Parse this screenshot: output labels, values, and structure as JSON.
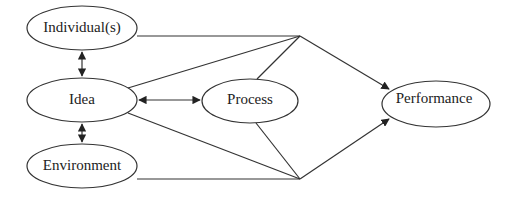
{
  "diagram": {
    "type": "flow",
    "nodes": [
      {
        "id": "individuals",
        "label": "Individual(s)",
        "cx": 82,
        "cy": 28,
        "rx": 55,
        "ry": 22
      },
      {
        "id": "idea",
        "label": "Idea",
        "cx": 82,
        "cy": 100,
        "rx": 55,
        "ry": 22
      },
      {
        "id": "process",
        "label": "Process",
        "cx": 250,
        "cy": 101,
        "rx": 48,
        "ry": 22
      },
      {
        "id": "environment",
        "label": "Environment",
        "cx": 82,
        "cy": 166,
        "rx": 55,
        "ry": 22
      },
      {
        "id": "performance",
        "label": "Performance",
        "cx": 436,
        "cy": 104,
        "rx": 54,
        "ry": 23
      }
    ],
    "edges": [
      {
        "from": "individuals",
        "to": "idea",
        "type": "bidirectional"
      },
      {
        "from": "idea",
        "to": "environment",
        "type": "bidirectional"
      },
      {
        "from": "idea",
        "to": "process",
        "type": "bidirectional"
      },
      {
        "from": "individuals",
        "to": "performance",
        "type": "directed",
        "via": "top-junction"
      },
      {
        "from": "idea",
        "to": "performance",
        "type": "directed",
        "via": "top-junction"
      },
      {
        "from": "process",
        "to": "performance",
        "type": "directed",
        "via": "top-junction"
      },
      {
        "from": "idea",
        "to": "performance",
        "type": "directed",
        "via": "bottom-junction"
      },
      {
        "from": "process",
        "to": "performance",
        "type": "directed",
        "via": "bottom-junction"
      },
      {
        "from": "environment",
        "to": "performance",
        "type": "directed",
        "via": "bottom-junction"
      }
    ],
    "junctions": {
      "top": {
        "x": 300,
        "y": 36
      },
      "bottom": {
        "x": 300,
        "y": 179
      }
    },
    "colors": {
      "stroke": "#333333",
      "text": "#222222",
      "background": "#ffffff"
    }
  }
}
